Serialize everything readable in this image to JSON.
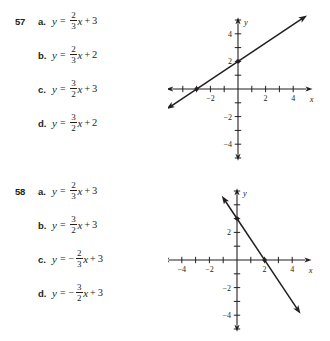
{
  "problems": [
    {
      "number": "57",
      "options": [
        {
          "letter": "a.",
          "lhs": "y",
          "eq": "=",
          "sign": "",
          "frac_num": "2",
          "frac_den": "3",
          "xvar": "x",
          "op": "+",
          "const": "3"
        },
        {
          "letter": "b.",
          "lhs": "y",
          "eq": "=",
          "sign": "",
          "frac_num": "2",
          "frac_den": "3",
          "xvar": "x",
          "op": "+",
          "const": "2"
        },
        {
          "letter": "c.",
          "lhs": "y",
          "eq": "=",
          "sign": "",
          "frac_num": "3",
          "frac_den": "2",
          "xvar": "x",
          "op": "+",
          "const": "3"
        },
        {
          "letter": "d.",
          "lhs": "y",
          "eq": "=",
          "sign": "",
          "frac_num": "3",
          "frac_den": "2",
          "xvar": "x",
          "op": "+",
          "const": "2"
        }
      ]
    },
    {
      "number": "58",
      "options": [
        {
          "letter": "a.",
          "lhs": "y",
          "eq": "=",
          "sign": "",
          "frac_num": "2",
          "frac_den": "3",
          "xvar": "x",
          "op": "+",
          "const": "3"
        },
        {
          "letter": "b.",
          "lhs": "y",
          "eq": "=",
          "sign": "",
          "frac_num": "3",
          "frac_den": "2",
          "xvar": "x",
          "op": "+",
          "const": "3"
        },
        {
          "letter": "c.",
          "lhs": "y",
          "eq": "=",
          "sign": "−",
          "frac_num": "2",
          "frac_den": "3",
          "xvar": "x",
          "op": "+",
          "const": "3"
        },
        {
          "letter": "d.",
          "lhs": "y",
          "eq": "=",
          "sign": "−",
          "frac_num": "3",
          "frac_den": "2",
          "xvar": "x",
          "op": "+",
          "const": "3"
        }
      ]
    }
  ],
  "chart_data": [
    {
      "type": "line",
      "title": "",
      "xlabel": "x",
      "ylabel": "y",
      "xlim": [
        -5.2,
        5.4
      ],
      "ylim": [
        -5.2,
        5.2
      ],
      "grid": false,
      "legend": null,
      "x_ticks": [
        -4,
        -3,
        -2,
        -1,
        1,
        2,
        3,
        4
      ],
      "x_tick_labels": [
        {
          "value": -2,
          "label": "−2"
        },
        {
          "value": 2,
          "label": "2"
        },
        {
          "value": 4,
          "label": "4"
        }
      ],
      "y_ticks": [
        -5,
        -4,
        -3,
        -2,
        -1,
        1,
        2,
        3,
        4,
        5
      ],
      "y_tick_labels": [
        {
          "value": 4,
          "label": "4"
        },
        {
          "value": 2,
          "label": "2"
        },
        {
          "value": -2,
          "label": "−2"
        },
        {
          "value": -4,
          "label": "−4"
        }
      ],
      "series": [
        {
          "name": "line-57",
          "slope": 0.6667,
          "intercept": 2,
          "x": [
            -5.2,
            5.0
          ],
          "y": [
            -1.47,
            5.33
          ],
          "arrows": "both",
          "points": [
            {
              "x": 0,
              "y": 2,
              "label": "y-intercept"
            },
            {
              "x": -3,
              "y": 0,
              "label": "x-intercept"
            }
          ]
        }
      ]
    },
    {
      "type": "line",
      "title": "",
      "xlabel": "x",
      "ylabel": "y",
      "xlim": [
        -5.4,
        5.4
      ],
      "ylim": [
        -5.2,
        5.2
      ],
      "grid": false,
      "legend": null,
      "x_ticks": [
        -4,
        -3,
        -2,
        -1,
        1,
        2,
        3,
        4
      ],
      "x_tick_labels": [
        {
          "value": -4,
          "label": "−4"
        },
        {
          "value": -2,
          "label": "−2"
        },
        {
          "value": 2,
          "label": "2"
        },
        {
          "value": 4,
          "label": "4"
        }
      ],
      "y_ticks": [
        -5,
        -4,
        -3,
        -2,
        -1,
        1,
        2,
        3,
        4,
        5
      ],
      "y_tick_labels": [
        {
          "value": 2,
          "label": "2"
        },
        {
          "value": -2,
          "label": "−2"
        },
        {
          "value": -4,
          "label": "−4"
        }
      ],
      "series": [
        {
          "name": "line-58",
          "slope": -1.5,
          "intercept": 3,
          "x": [
            -1.1,
            4.6
          ],
          "y": [
            4.65,
            -3.9
          ],
          "arrows": "both",
          "points": [
            {
              "x": 0,
              "y": 3,
              "label": "y-intercept"
            },
            {
              "x": 2,
              "y": 0,
              "label": "x-intercept"
            }
          ]
        }
      ]
    }
  ],
  "colors": {
    "ink": "#231f20",
    "background": "#ffffff"
  }
}
